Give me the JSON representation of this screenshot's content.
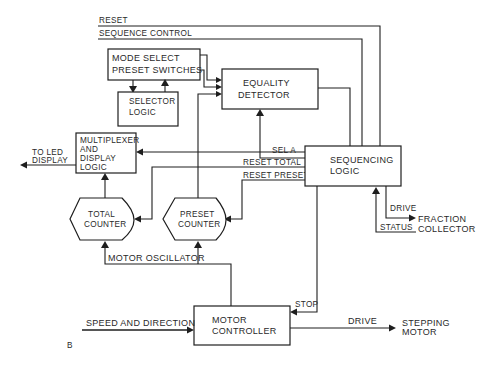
{
  "diagram": {
    "figure_label": "B",
    "blocks": {
      "mode_select": {
        "line1": "MODE SELECT",
        "line2": "PRESET SWITCHES"
      },
      "selector_logic": {
        "line1": "SELECTOR",
        "line2": "LOGIC"
      },
      "equality_detector": {
        "line1": "EQUALITY",
        "line2": "DETECTOR"
      },
      "multiplexer": {
        "line1": "MULTIPLEXER",
        "line2": "AND",
        "line3": "DISPLAY",
        "line4": "LOGIC"
      },
      "sequencing_logic": {
        "line1": "SEQUENCING",
        "line2": "LOGIC"
      },
      "total_counter": {
        "line1": "TOTAL",
        "line2": "COUNTER"
      },
      "preset_counter": {
        "line1": "PRESET",
        "line2": "COUNTER"
      },
      "motor_controller": {
        "line1": "MOTOR",
        "line2": "CONTROLLER"
      }
    },
    "signals": {
      "reset": "RESET",
      "sequence_control": "SEQUENCE CONTROL",
      "sel_a": "SEL A",
      "reset_total": "RESET TOTAL",
      "reset_preset": "RESET PRESET",
      "drive_fraction": "DRIVE",
      "status": "STATUS",
      "motor_oscillator": "MOTOR OSCILLATOR",
      "stop": "STOP",
      "speed_direction": "SPEED AND DIRECTION",
      "drive_motor": "DRIVE"
    },
    "endpoints": {
      "led_display": {
        "line1": "TO LED",
        "line2": "DISPLAY"
      },
      "fraction_collector": {
        "line1": "FRACTION",
        "line2": "COLLECTOR"
      },
      "stepping_motor": {
        "line1": "STEPPING",
        "line2": "MOTOR"
      }
    }
  }
}
